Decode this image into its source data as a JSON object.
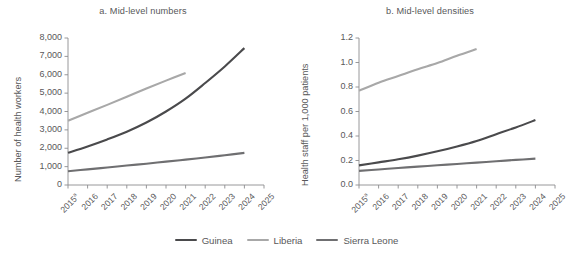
{
  "figure": {
    "width": 573,
    "height": 253,
    "background": "#ffffff",
    "text_color": "#58585a"
  },
  "legend": {
    "position": "bottom-center",
    "items": [
      {
        "label": "Guinea",
        "color": "#4a4a4c",
        "swatch_name": "legend-swatch-guinea"
      },
      {
        "label": "Liberia",
        "color": "#a8a8a8",
        "swatch_name": "legend-swatch-liberia"
      },
      {
        "label": "Sierra Leone",
        "color": "#6f6f71",
        "swatch_name": "legend-swatch-sierra-leone"
      }
    ]
  },
  "chart_data": [
    {
      "id": "panel-a",
      "type": "line",
      "title": "a. Mid-level numbers",
      "xlabel": "",
      "ylabel": "Number of health workers",
      "x": [
        2015,
        2016,
        2017,
        2018,
        2019,
        2020,
        2021,
        2022,
        2023,
        2024,
        2025
      ],
      "xtick_labels": [
        "2015",
        "2016",
        "2017",
        "2018",
        "2019",
        "2020",
        "2021",
        "2022",
        "2023",
        "2024",
        "2025"
      ],
      "xtick_footnote": "a",
      "xtick_footnote_on": "2015",
      "ytick_labels": [
        "0",
        "1,000",
        "2,000",
        "3,000",
        "4,000",
        "5,000",
        "6,000",
        "7,000",
        "8,000"
      ],
      "ytick_values": [
        0,
        1000,
        2000,
        3000,
        4000,
        5000,
        6000,
        7000,
        8000
      ],
      "ylim": [
        0,
        8000
      ],
      "xlim": [
        2015,
        2025
      ],
      "grid": false,
      "series": [
        {
          "name": "Guinea",
          "color": "#4a4a4c",
          "x": [
            2015,
            2016,
            2017,
            2018,
            2019,
            2020,
            2021,
            2022,
            2023,
            2024
          ],
          "values": [
            1750,
            2100,
            2480,
            2900,
            3400,
            4000,
            4700,
            5550,
            6450,
            7450
          ]
        },
        {
          "name": "Liberia",
          "color": "#a8a8a8",
          "x": [
            2015,
            2016,
            2017,
            2018,
            2019,
            2020,
            2021
          ],
          "values": [
            3500,
            3930,
            4360,
            4800,
            5250,
            5680,
            6100
          ]
        },
        {
          "name": "Sierra Leone",
          "color": "#6f6f71",
          "x": [
            2015,
            2016,
            2017,
            2018,
            2019,
            2020,
            2021,
            2022,
            2023,
            2024
          ],
          "values": [
            750,
            850,
            950,
            1060,
            1160,
            1270,
            1380,
            1500,
            1620,
            1750
          ]
        }
      ]
    },
    {
      "id": "panel-b",
      "type": "line",
      "title": "b. Mid-level densities",
      "xlabel": "",
      "ylabel": "Health staff  per 1,000 patients",
      "x": [
        2015,
        2016,
        2017,
        2018,
        2019,
        2020,
        2021,
        2022,
        2023,
        2024,
        2025
      ],
      "xtick_labels": [
        "2015",
        "2016",
        "2017",
        "2018",
        "2019",
        "2020",
        "2021",
        "2022",
        "2023",
        "2024",
        "2025"
      ],
      "xtick_footnote": "a",
      "xtick_footnote_on": "2015",
      "ytick_labels": [
        "0.0",
        "0.2",
        "0.4",
        "0.6",
        "0.8",
        "1.0",
        "1.2"
      ],
      "ytick_values": [
        0.0,
        0.2,
        0.4,
        0.6,
        0.8,
        1.0,
        1.2
      ],
      "ylim": [
        0,
        1.2
      ],
      "xlim": [
        2015,
        2025
      ],
      "grid": false,
      "series": [
        {
          "name": "Guinea",
          "color": "#4a4a4c",
          "x": [
            2015,
            2016,
            2017,
            2018,
            2019,
            2020,
            2021,
            2022,
            2023,
            2024
          ],
          "values": [
            0.16,
            0.185,
            0.21,
            0.24,
            0.275,
            0.315,
            0.36,
            0.415,
            0.47,
            0.53
          ]
        },
        {
          "name": "Liberia",
          "color": "#a8a8a8",
          "x": [
            2015,
            2016,
            2017,
            2018,
            2019,
            2020,
            2021
          ],
          "values": [
            0.77,
            0.835,
            0.89,
            0.945,
            0.995,
            1.055,
            1.11
          ]
        },
        {
          "name": "Sierra Leone",
          "color": "#6f6f71",
          "x": [
            2015,
            2016,
            2017,
            2018,
            2019,
            2020,
            2021,
            2022,
            2023,
            2024
          ],
          "values": [
            0.115,
            0.127,
            0.139,
            0.15,
            0.161,
            0.172,
            0.183,
            0.194,
            0.205,
            0.215
          ]
        }
      ]
    }
  ]
}
